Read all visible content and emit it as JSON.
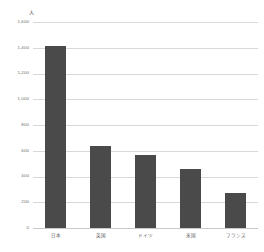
{
  "chart_data": {
    "type": "bar",
    "title": "",
    "xlabel": "",
    "ylabel": "人",
    "yunit": "人",
    "categories": [
      "日本",
      "英国",
      "ドイツ",
      "米国",
      "フランス"
    ],
    "values": [
      1410,
      640,
      570,
      455,
      270
    ],
    "ylim": [
      0,
      1600
    ],
    "ytick_values": [
      0,
      200,
      400,
      600,
      800,
      1000,
      1200,
      1400,
      1600
    ],
    "ytick_labels": [
      "0",
      "200",
      "400",
      "600",
      "800",
      "1,000",
      "1,200",
      "1,400",
      "1,600"
    ],
    "grid": true,
    "legend": false,
    "legend_position": "none",
    "bar_color": "#4a4a4a",
    "grid_color": "#d9d9d9",
    "axis_color": "#c8c8c8",
    "label_color": "#5d5d5d",
    "series": [
      {
        "name": "",
        "values": [
          1410,
          640,
          570,
          455,
          270
        ]
      }
    ]
  }
}
